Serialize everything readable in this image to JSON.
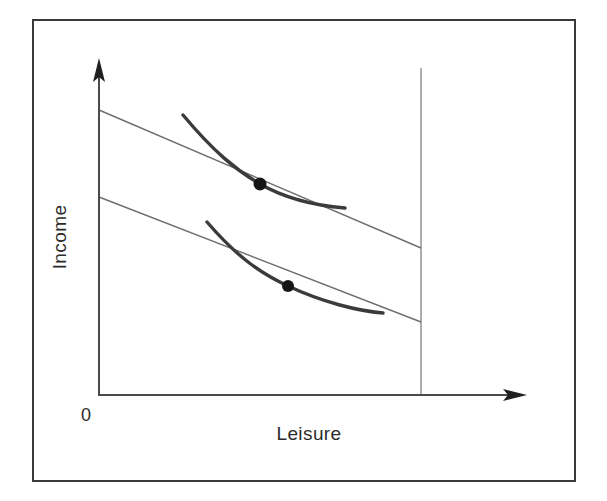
{
  "figure": {
    "kind": "labor-leisure-indifference-curve-diagram",
    "background_color": "#ffffff",
    "frame": {
      "color": "#3a3a3a",
      "x": 33,
      "y": 20,
      "width": 542,
      "height": 461,
      "stroke_width": 2
    },
    "axes": {
      "color": "#4a4a4a",
      "stroke_width": 2,
      "y_axis": {
        "x": 99,
        "y_top": 58,
        "y_bottom": 395,
        "arrow": "up-arrow"
      },
      "x_axis": {
        "y": 395,
        "x_left": 99,
        "x_right": 527,
        "arrow": "right-arrow"
      },
      "y_label": "Income",
      "x_label": "Leisure",
      "origin_label": "0"
    },
    "endowment_line": {
      "name": "total-time-endowment",
      "color": "#8a8a8a",
      "stroke_width": 1.4,
      "x": 421,
      "y_top": 68,
      "y_bottom": 395
    },
    "budget_lines": [
      {
        "name": "budget-line-high-wage",
        "color": "#6e6e6e",
        "stroke_width": 1.4,
        "x1": 99,
        "y1": 110,
        "x2": 421,
        "y2": 248
      },
      {
        "name": "budget-line-low-wage",
        "color": "#6e6e6e",
        "stroke_width": 1.4,
        "x1": 99,
        "y1": 197,
        "x2": 421,
        "y2": 322
      }
    ],
    "indifference_curves": [
      {
        "name": "indifference-curve-upper",
        "color": "#3b3b3b",
        "stroke_width": 3.4,
        "path": "M 183 115 C 214 152 236 170 260 184 C 288 200 320 206 345 208"
      },
      {
        "name": "indifference-curve-lower",
        "color": "#3b3b3b",
        "stroke_width": 3.4,
        "path": "M 207 222 C 238 258 262 274 288 286 C 322 302 358 311 383 313"
      }
    ],
    "tangency_points": [
      {
        "name": "tangency-point-upper",
        "cx": 260,
        "cy": 184,
        "r": 6.5,
        "color": "#151515"
      },
      {
        "name": "tangency-point-lower",
        "cx": 288,
        "cy": 286,
        "r": 6.0,
        "color": "#151515"
      }
    ]
  },
  "chart_data": {
    "type": "line",
    "title": "",
    "xlabel": "Leisure",
    "ylabel": "Income",
    "origin_label": "0",
    "grid": false,
    "legend": "none",
    "xlim": [
      0,
      1
    ],
    "ylim": [
      0,
      1
    ],
    "axis_ticks": {
      "x": [],
      "y": []
    },
    "series": [
      {
        "name": "Budget line (higher wage)",
        "type": "line",
        "style": "thin",
        "x": [
          0.0,
          1.0
        ],
        "y": [
          0.846,
          0.437
        ]
      },
      {
        "name": "Budget line (lower wage)",
        "type": "line",
        "style": "thin",
        "x": [
          0.0,
          1.0
        ],
        "y": [
          0.588,
          0.217
        ]
      },
      {
        "name": "Indifference curve (higher)",
        "type": "curve",
        "style": "thick",
        "x": [
          0.261,
          0.389,
          0.5,
          0.621,
          0.764
        ],
        "y": [
          0.831,
          0.71,
          0.626,
          0.576,
          0.555
        ]
      },
      {
        "name": "Indifference curve (lower)",
        "type": "curve",
        "style": "thick",
        "x": [
          0.335,
          0.46,
          0.587,
          0.717,
          0.882
        ],
        "y": [
          0.513,
          0.394,
          0.323,
          0.283,
          0.243
        ]
      },
      {
        "name": "Total time endowment",
        "type": "vertical-line",
        "style": "thin",
        "x": [
          1.0,
          1.0
        ],
        "y": [
          0.0,
          0.97
        ]
      }
    ],
    "annotations": [
      {
        "label": "Optimal choice (higher wage)",
        "x": 0.5,
        "y": 0.626,
        "marker": "filled-dot"
      },
      {
        "label": "Optimal choice (lower wage)",
        "x": 0.587,
        "y": 0.323,
        "marker": "filled-dot"
      }
    ]
  }
}
